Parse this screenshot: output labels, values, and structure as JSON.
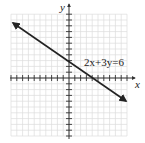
{
  "chart_data": {
    "type": "line",
    "title": "",
    "xlabel": "x",
    "ylabel": "y",
    "xlim": [
      -10,
      10
    ],
    "ylim": [
      -10,
      11
    ],
    "grid": true,
    "series": [
      {
        "name": "2x+3y=6",
        "equation": "2x+3y=6",
        "x": [
          -9.6,
          0,
          3,
          9.8
        ],
        "y": [
          8.4,
          2,
          0,
          -4.5
        ],
        "intercepts": {
          "x": 3,
          "y": 2
        },
        "arrows": "both"
      }
    ],
    "annotations": [
      {
        "text": "2x+3y=6",
        "x": 4.3,
        "y": 2.2
      }
    ]
  },
  "labels": {
    "x_axis": "x",
    "y_axis": "y",
    "equation": "2x+3y=6"
  },
  "colors": {
    "grid": "#dcdcdc",
    "axis": "#333333",
    "line": "#222222"
  }
}
